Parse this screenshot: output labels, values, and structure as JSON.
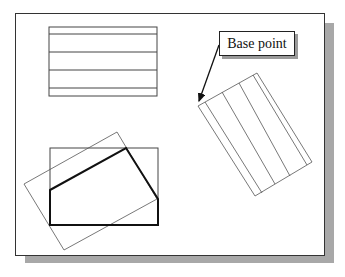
{
  "figure": {
    "label": {
      "text": "Base point"
    },
    "colors": {
      "line": "#444444",
      "bold_line": "#111111",
      "shadow": "#a8a8a8",
      "background": "#ffffff"
    },
    "shapes": {
      "top_rectangle": {
        "x": 49,
        "y": 27,
        "width": 108,
        "height": 69,
        "inner_lines_y": [
          34,
          52,
          70,
          88
        ]
      },
      "rotated_rectangle_right": {
        "points": [
          [
            198,
            106
          ],
          [
            257,
            73
          ],
          [
            312,
            162
          ],
          [
            255,
            196
          ]
        ]
      },
      "bottom_rectangle": {
        "x": 50,
        "y": 148,
        "width": 108,
        "height": 77
      },
      "bold_polygon": {
        "points": [
          [
            50,
            190
          ],
          [
            126,
            148
          ],
          [
            158,
            199
          ],
          [
            158,
            225
          ],
          [
            50,
            225
          ]
        ]
      },
      "rotated_rectangle_bottom": {
        "points": [
          [
            24,
            184
          ],
          [
            117,
            132
          ],
          [
            157,
            199
          ],
          [
            64,
            250
          ]
        ]
      },
      "arrow": {
        "from": [
          219,
          45
        ],
        "to": [
          198,
          104
        ]
      }
    }
  }
}
